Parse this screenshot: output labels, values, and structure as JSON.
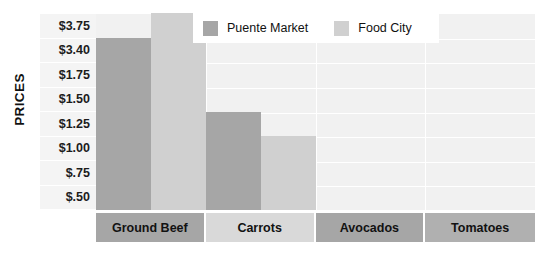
{
  "chart": {
    "title": "",
    "axis_title_y": "PRICES"
  },
  "legend": {
    "position": "top-right",
    "items": [
      {
        "label": "Puente Market",
        "color": "#a6a6a6",
        "icon": "legend-swatch-icon"
      },
      {
        "label": "Food City",
        "color": "#d0d0d0",
        "icon": "legend-swatch-icon"
      }
    ]
  },
  "chart_data": {
    "type": "bar",
    "title": "",
    "xlabel": "",
    "ylabel": "PRICES",
    "grid": true,
    "legend_position": "top-right",
    "categories": [
      "Ground Beef",
      "Carrots",
      "Avocados",
      "Tomatoes"
    ],
    "ytick_labels": [
      "$3.75",
      "$3.40",
      "$1.75",
      "$1.50",
      "$1.25",
      "$1.00",
      "$.75",
      "$.50"
    ],
    "ytick_order": "top-to-bottom",
    "note": "Y axis tick spacing is uneven/non-linear as printed; bars are read against the banded gridlines.",
    "series": [
      {
        "name": "Puente Market",
        "color": "#a6a6a6",
        "values": [
          3.4,
          1.25,
          null,
          null
        ],
        "value_labels": [
          "$3.40",
          "$1.25",
          "",
          ""
        ]
      },
      {
        "name": "Food City",
        "color": "#d0d0d0",
        "values": [
          3.75,
          1.0,
          null,
          null
        ],
        "value_labels": [
          "$3.75",
          "$1.00",
          "",
          ""
        ]
      }
    ]
  },
  "category_strip": [
    {
      "label": "Ground Beef",
      "fill": "#a6a6a6"
    },
    {
      "label": "Carrots",
      "fill": "#d9d9d9"
    },
    {
      "label": "Avocados",
      "fill": "#a6a6a6"
    },
    {
      "label": "Tomatoes",
      "fill": "#b0b0b0"
    }
  ],
  "colors": {
    "plot_background": "#f1f1f1",
    "label_background": "#f4f4f4",
    "gridline": "#ffffff",
    "series_dark": "#a6a6a6",
    "series_light": "#d0d0d0",
    "text": "#111111"
  }
}
